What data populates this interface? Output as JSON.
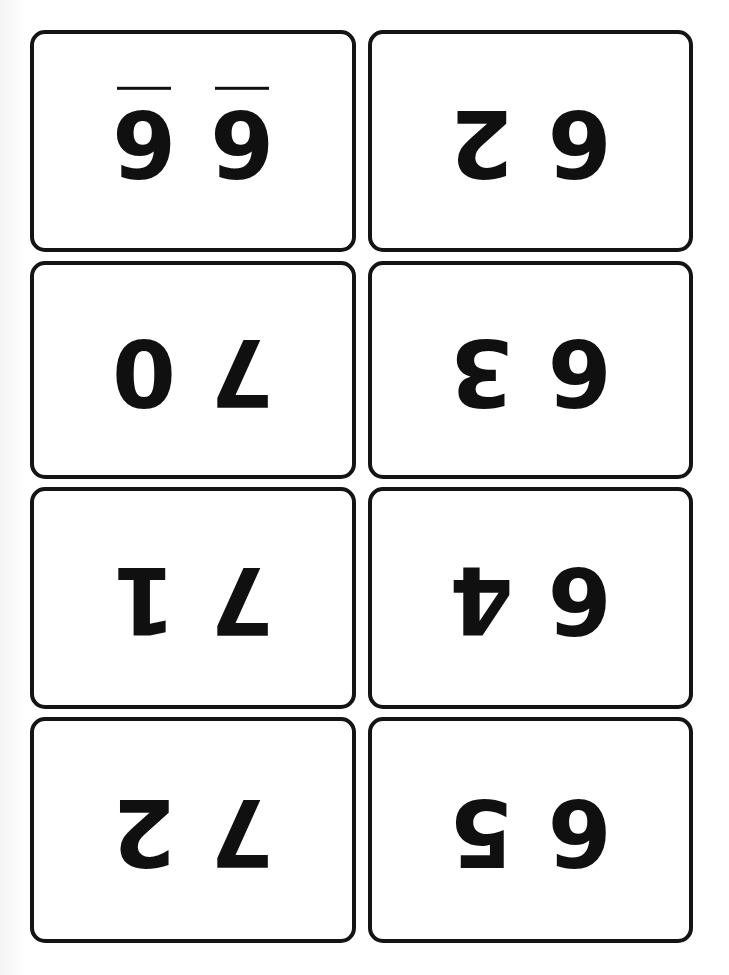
{
  "sheet": {
    "title": "Number Flashcards Sheet",
    "orientation": "rotated-180",
    "columns": 2,
    "rows": 4,
    "background_color": "#ffffff",
    "ink_color": "#101010",
    "card_border_color": "#141414",
    "card_fill_color": "#ffffff"
  },
  "cards": [
    {
      "position": "row-1-left",
      "digits": [
        {
          "value": "6",
          "underline": true
        },
        {
          "value": "6",
          "underline": true
        }
      ]
    },
    {
      "position": "row-1-right",
      "digits": [
        {
          "value": "6",
          "underline": false
        },
        {
          "value": "2",
          "underline": false
        }
      ]
    },
    {
      "position": "row-2-left",
      "digits": [
        {
          "value": "7",
          "underline": false
        },
        {
          "value": "0",
          "underline": false
        }
      ]
    },
    {
      "position": "row-2-right",
      "digits": [
        {
          "value": "6",
          "underline": false
        },
        {
          "value": "3",
          "underline": false
        }
      ]
    },
    {
      "position": "row-3-left",
      "digits": [
        {
          "value": "7",
          "underline": false
        },
        {
          "value": "1",
          "underline": false
        }
      ]
    },
    {
      "position": "row-3-right",
      "digits": [
        {
          "value": "6",
          "underline": false
        },
        {
          "value": "4",
          "underline": false
        }
      ]
    },
    {
      "position": "row-4-left",
      "digits": [
        {
          "value": "7",
          "underline": false
        },
        {
          "value": "2",
          "underline": false
        }
      ]
    },
    {
      "position": "row-4-right",
      "digits": [
        {
          "value": "6",
          "underline": false
        },
        {
          "value": "5",
          "underline": false
        }
      ]
    }
  ]
}
